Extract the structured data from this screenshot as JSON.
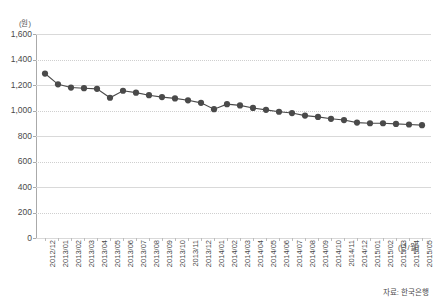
{
  "chart_title": "",
  "y_unit_label": "(원)",
  "x_unit_label": "(년/월)",
  "source_note": "자료: 한국은행",
  "chart_data": {
    "type": "line",
    "title": "",
    "subtitle": "",
    "xlabel": "(년/월)",
    "ylabel": "(원)",
    "ylim": [
      0,
      1600
    ],
    "ytick_step": 200,
    "yticks": [
      "1,600",
      "1,400",
      "1,200",
      "1,000",
      "800",
      "600",
      "400",
      "200",
      "0"
    ],
    "ytick_values": [
      1600,
      1400,
      1200,
      1000,
      800,
      600,
      400,
      200,
      0
    ],
    "grid": true,
    "legend": "none",
    "marker": "circle",
    "line_color": "#4a4a4a",
    "marker_color": "#4a4a4a",
    "categories": [
      "2012/12",
      "2013/01",
      "2013/02",
      "2013/03",
      "2013/04",
      "2013/05",
      "2013/06",
      "2013/07",
      "2013/08",
      "2013/09",
      "2013/10",
      "2013/11",
      "2013/12",
      "2014/01",
      "2014/02",
      "2014/03",
      "2014/04",
      "2014/05",
      "2014/06",
      "2014/07",
      "2014/08",
      "2014/09",
      "2014/10",
      "2014/11",
      "2014/12",
      "2015/01",
      "2015/02",
      "2015/03",
      "2015/04",
      "2015/05"
    ],
    "values": [
      1290,
      1205,
      1180,
      1175,
      1170,
      1100,
      1155,
      1140,
      1120,
      1105,
      1095,
      1080,
      1060,
      1010,
      1050,
      1040,
      1020,
      1005,
      990,
      980,
      960,
      950,
      935,
      925,
      905,
      900,
      900,
      895,
      890,
      885
    ],
    "series": [
      {
        "name": "환율",
        "values": [
          1290,
          1205,
          1180,
          1175,
          1170,
          1100,
          1155,
          1140,
          1120,
          1105,
          1095,
          1080,
          1060,
          1010,
          1050,
          1040,
          1020,
          1005,
          990,
          980,
          960,
          950,
          935,
          925,
          905,
          900,
          900,
          895,
          890,
          885
        ]
      }
    ]
  }
}
